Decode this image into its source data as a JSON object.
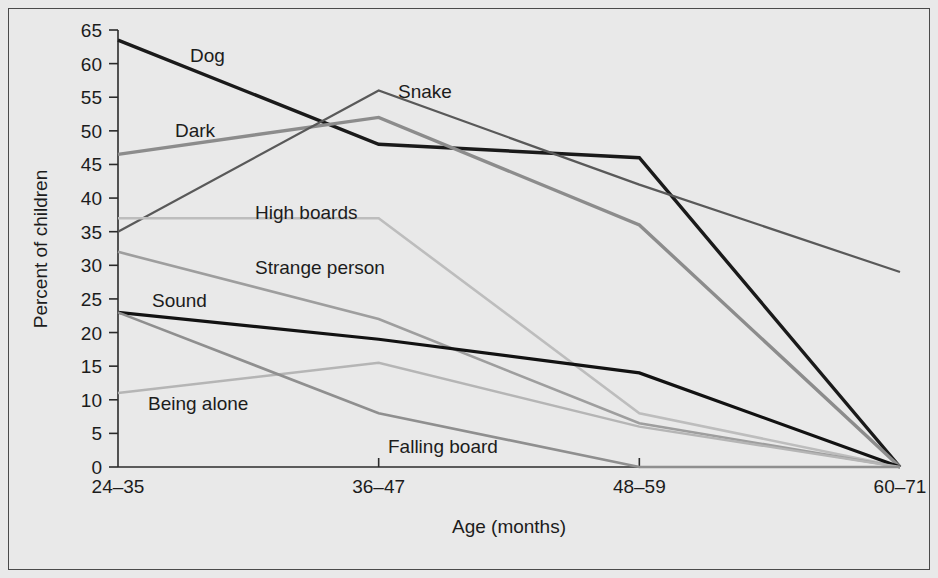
{
  "figure": {
    "background_color": "#e9e9e9",
    "border_color": "#4a4a4a"
  },
  "chart_data": {
    "type": "line",
    "title": "",
    "subtitle": "",
    "xlabel": "Age (months)",
    "ylabel": "Percent of children",
    "categories": [
      "24–35",
      "36–47",
      "48–59",
      "60–71"
    ],
    "ylim": [
      0,
      65
    ],
    "yticks": [
      0,
      5,
      10,
      15,
      20,
      25,
      30,
      35,
      40,
      45,
      50,
      55,
      60,
      65
    ],
    "ytick_labels": [
      "0",
      "5",
      "10",
      "15",
      "20",
      "25",
      "30",
      "35",
      "40",
      "45",
      "50",
      "55",
      "60",
      "65"
    ],
    "grid": false,
    "legend": "inline-labels",
    "legend_position": "inline",
    "series": [
      {
        "name": "Dog",
        "label": "Dog",
        "color": "#1a1a1a",
        "width": 3.4,
        "values": [
          63.5,
          48,
          46,
          0
        ],
        "label_x": 190,
        "label_y": 62
      },
      {
        "name": "Dark",
        "label": "Dark",
        "color": "#8c8c8c",
        "width": 3.4,
        "values": [
          46.5,
          52,
          36,
          0
        ],
        "label_x": 175,
        "label_y": 137
      },
      {
        "name": "Snake",
        "label": "Snake",
        "color": "#595959",
        "width": 2.2,
        "values": [
          35,
          56,
          42,
          29
        ],
        "label_x": 398,
        "label_y": 98
      },
      {
        "name": "High boards",
        "label": "High boards",
        "color": "#bdbdbd",
        "width": 2.6,
        "values": [
          37,
          37,
          8,
          0
        ],
        "label_x": 255,
        "label_y": 219
      },
      {
        "name": "Strange person",
        "label": "Strange person",
        "color": "#9e9e9e",
        "width": 2.6,
        "values": [
          32,
          22,
          6.5,
          0
        ],
        "label_x": 255,
        "label_y": 274
      },
      {
        "name": "Sound",
        "label": "Sound",
        "color": "#121212",
        "width": 3.2,
        "values": [
          23,
          19,
          14,
          0
        ],
        "label_x": 152,
        "label_y": 307
      },
      {
        "name": "Being alone",
        "label": "Being alone",
        "color": "#b5b5b5",
        "width": 2.4,
        "values": [
          11,
          15.5,
          6,
          0
        ],
        "label_x": 148,
        "label_y": 410
      },
      {
        "name": "Falling board",
        "label": "Falling board",
        "color": "#8f8f8f",
        "width": 2.6,
        "values": [
          23,
          8,
          0,
          0
        ],
        "label_x": 388,
        "label_y": 453
      }
    ]
  }
}
